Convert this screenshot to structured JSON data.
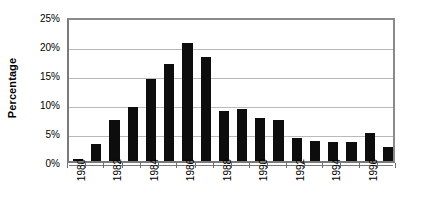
{
  "chart_data": {
    "type": "bar",
    "title": "",
    "xlabel": "",
    "ylabel": "Percentage",
    "ylim": [
      0,
      25
    ],
    "yticks": [
      0,
      5,
      10,
      15,
      20,
      25
    ],
    "ytick_labels": [
      "0%",
      "5%",
      "10%",
      "15%",
      "20%",
      "25%"
    ],
    "grid": true,
    "legend": "none",
    "bar_color": "#0d0d0d",
    "gridline_color": "#b9b9b9",
    "axis_color": "#7a7a7a",
    "categories": [
      "1980",
      "1981",
      "1982",
      "1983",
      "1984",
      "1985",
      "1986",
      "1987",
      "1988",
      "1989",
      "1990",
      "1991",
      "1992",
      "1993",
      "1994",
      "1995",
      "1996",
      "1997"
    ],
    "xtick_labels": [
      "1980",
      "1982",
      "1984",
      "1986",
      "1988",
      "1990",
      "1992",
      "1994",
      "1996"
    ],
    "values": [
      0.3,
      3.0,
      7.0,
      9.3,
      14.2,
      16.8,
      20.4,
      18.0,
      8.7,
      9.0,
      7.4,
      7.0,
      4.0,
      3.4,
      3.2,
      3.2,
      4.8,
      2.4
    ],
    "series": [
      {
        "name": "Percentage",
        "values": [
          0.3,
          3.0,
          7.0,
          9.3,
          14.2,
          16.8,
          20.4,
          18.0,
          8.7,
          9.0,
          7.4,
          7.0,
          4.0,
          3.4,
          3.2,
          3.2,
          4.8,
          2.4
        ]
      }
    ]
  }
}
